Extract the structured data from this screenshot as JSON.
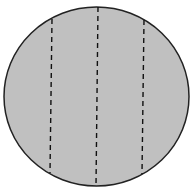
{
  "diagram": {
    "shape": "circle",
    "fill": "#c0c0c0",
    "stroke": "#222222",
    "cx": 96.5,
    "cy": 96.5,
    "rx": 92.5,
    "ry": 89.5,
    "dashed_lines": [
      {
        "x1": 52,
        "y1": 19,
        "x2": 50,
        "y2": 173
      },
      {
        "x1": 98,
        "y1": 7,
        "x2": 96,
        "y2": 186
      },
      {
        "x1": 144,
        "y1": 20,
        "x2": 142,
        "y2": 174
      }
    ],
    "dash_color": "#111111"
  }
}
